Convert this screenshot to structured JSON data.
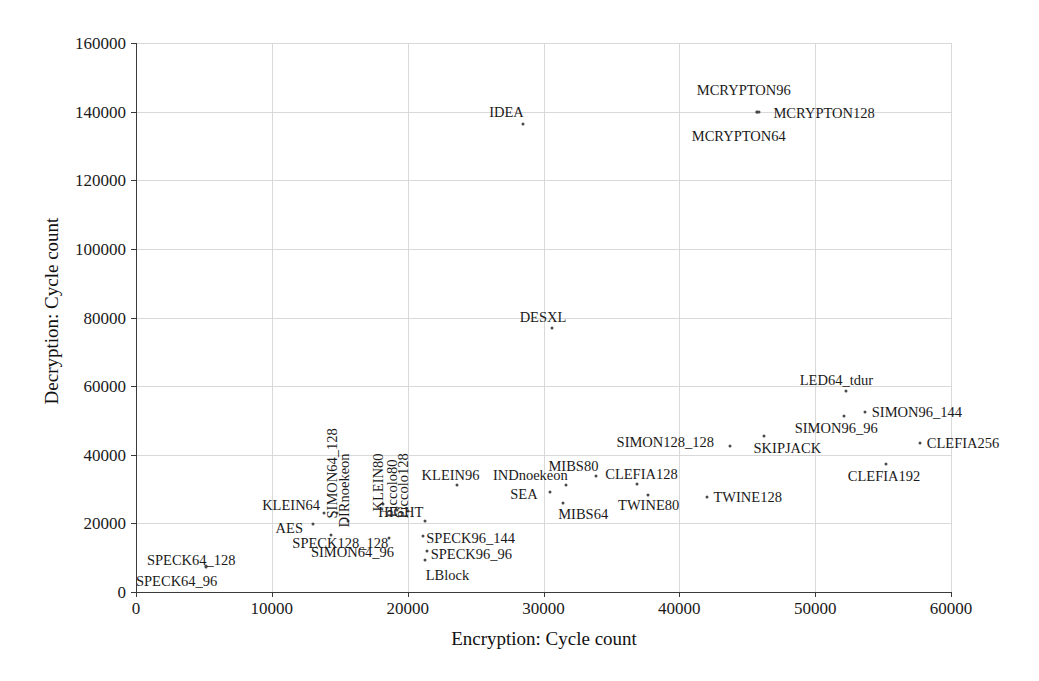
{
  "chart_data": {
    "type": "scatter",
    "title": "",
    "xlabel": "Encryption: Cycle count",
    "ylabel": "Decryption: Cycle count",
    "xlim": [
      0,
      60000
    ],
    "ylim": [
      0,
      160000
    ],
    "xticks": [
      0,
      10000,
      20000,
      30000,
      40000,
      50000,
      60000
    ],
    "yticks": [
      0,
      20000,
      40000,
      60000,
      80000,
      100000,
      120000,
      140000,
      160000
    ],
    "xtick_labels": [
      "0",
      "10000",
      "20000",
      "30000",
      "40000",
      "50000",
      "60000"
    ],
    "ytick_labels": [
      "0",
      "20000",
      "40000",
      "60000",
      "80000",
      "100000",
      "120000",
      "140000",
      "160000"
    ],
    "grid": true,
    "legend": "none",
    "marker_color": "#4a4a4a",
    "grid_color": "#d9d9d9",
    "axis_color": "#3a3a3a",
    "points": [
      {
        "label": "SPECK64_96",
        "x": 5150,
        "y": 7300,
        "lx": -70,
        "ly": 14,
        "rot": false
      },
      {
        "label": "SPECK64_128",
        "x": 5150,
        "y": 7600,
        "lx": -59,
        "ly": -6,
        "rot": false
      },
      {
        "label": "AES",
        "x": 13000,
        "y": 19800,
        "lx": -37,
        "ly": 4,
        "rot": false
      },
      {
        "label": "KLEIN64",
        "x": 13850,
        "y": 23000,
        "lx": -62,
        "ly": -8,
        "rot": false
      },
      {
        "label": "SIMON64_96",
        "x": 14350,
        "y": 16600,
        "lx": -20,
        "ly": 17,
        "rot": false
      },
      {
        "label": "SIMON64_128",
        "x": 14800,
        "y": 23000,
        "lx": 2,
        "ly": -9,
        "rot": true
      },
      {
        "label": "DIRnoekeon",
        "x": 15600,
        "y": 20700,
        "lx": 3,
        "ly": -8,
        "rot": true
      },
      {
        "label": "KLEIN80",
        "x": 18150,
        "y": 25600,
        "lx": 2,
        "ly": -7,
        "rot": true
      },
      {
        "label": "Piccolo80",
        "x": 19200,
        "y": 23800,
        "lx": 2,
        "ly": -7,
        "rot": true
      },
      {
        "label": "Piccolo128",
        "x": 20050,
        "y": 23500,
        "lx": 2,
        "ly": -7,
        "rot": true
      },
      {
        "label": "SPECK128_128",
        "x": 18650,
        "y": 15800,
        "lx": -97,
        "ly": 5,
        "rot": false
      },
      {
        "label": "HIGHT",
        "x": 21300,
        "y": 20700,
        "lx": -47,
        "ly": -9,
        "rot": false
      },
      {
        "label": "SPECK96_144",
        "x": 21150,
        "y": 16300,
        "lx": 3,
        "ly": 2,
        "rot": false
      },
      {
        "label": "SPECK96_96",
        "x": 21400,
        "y": 12000,
        "lx": 4,
        "ly": 3,
        "rot": false
      },
      {
        "label": "LBlock",
        "x": 21250,
        "y": 9400,
        "lx": 1,
        "ly": 15,
        "rot": false
      },
      {
        "label": "KLEIN96",
        "x": 23600,
        "y": 31300,
        "lx": -35,
        "ly": -10,
        "rot": false
      },
      {
        "label": "SEA",
        "x": 30500,
        "y": 29000,
        "lx": -40,
        "ly": 2,
        "rot": false
      },
      {
        "label": "INDnoekeon",
        "x": 31650,
        "y": 31300,
        "lx": -73,
        "ly": -10,
        "rot": false
      },
      {
        "label": "MIBS64",
        "x": 31450,
        "y": 25800,
        "lx": -5,
        "ly": 11,
        "rot": false
      },
      {
        "label": "MIBS80",
        "x": 33900,
        "y": 33700,
        "lx": -48,
        "ly": -10,
        "rot": false
      },
      {
        "label": "CLEFIA128",
        "x": 36900,
        "y": 31500,
        "lx": -32,
        "ly": -10,
        "rot": false
      },
      {
        "label": "TWINE80",
        "x": 37700,
        "y": 28300,
        "lx": -30,
        "ly": 10,
        "rot": false
      },
      {
        "label": "TWINE128",
        "x": 42000,
        "y": 27800,
        "lx": 7,
        "ly": 0,
        "rot": false
      },
      {
        "label": "SIMON128_128",
        "x": 43700,
        "y": 42600,
        "lx": -113,
        "ly": -4,
        "rot": false
      },
      {
        "label": "SKIPJACK",
        "x": 46200,
        "y": 45500,
        "lx": -10,
        "ly": 12,
        "rot": false
      },
      {
        "label": "SIMON96_96",
        "x": 52100,
        "y": 51300,
        "lx": -49,
        "ly": 12,
        "rot": false
      },
      {
        "label": "SIMON96_144",
        "x": 53650,
        "y": 52500,
        "lx": 7,
        "ly": 0,
        "rot": false
      },
      {
        "label": "LED64_tdur",
        "x": 52250,
        "y": 58600,
        "lx": -46,
        "ly": -11,
        "rot": false
      },
      {
        "label": "CLEFIA256",
        "x": 57700,
        "y": 43400,
        "lx": 7,
        "ly": 0,
        "rot": false
      },
      {
        "label": "CLEFIA192",
        "x": 55200,
        "y": 37400,
        "lx": -38,
        "ly": 12,
        "rot": false
      },
      {
        "label": "DESXL",
        "x": 30600,
        "y": 76800,
        "lx": -32,
        "ly": -11,
        "rot": false
      },
      {
        "label": "IDEA",
        "x": 28500,
        "y": 136500,
        "lx": -34,
        "ly": -12,
        "rot": false
      },
      {
        "label": "MCRYPTON64",
        "x": 45700,
        "y": 140000,
        "lx": -65,
        "ly": 24,
        "rot": false
      },
      {
        "label": "MCRYPTON96",
        "x": 45700,
        "y": 140000,
        "lx": -60,
        "ly": -22,
        "rot": false
      },
      {
        "label": "MCRYPTON128",
        "x": 45900,
        "y": 140000,
        "lx": 14,
        "ly": 1,
        "rot": false
      }
    ]
  }
}
